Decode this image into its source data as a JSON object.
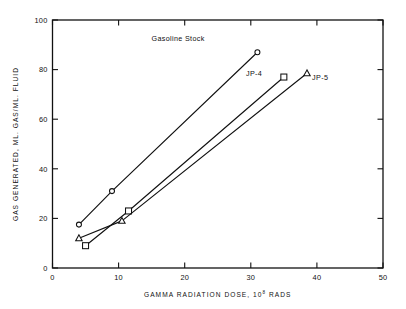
{
  "chart_data": {
    "type": "line",
    "title": "",
    "xlabel": "GAMMA RADIATION DOSE, 10",
    "xlabel_exponent": "8",
    "xlabel_tail": " RADS",
    "ylabel": "GAS GENERATED, ML. GAS/ML. FLUID",
    "xlim": [
      0,
      50
    ],
    "ylim": [
      0,
      100
    ],
    "xticks": [
      0,
      10,
      20,
      30,
      40,
      50
    ],
    "yticks": [
      0,
      20,
      40,
      60,
      80,
      100
    ],
    "xtick_labels": [
      "0",
      "10",
      "20",
      "30",
      "40",
      "50"
    ],
    "ytick_labels": [
      "0",
      "20",
      "40",
      "60",
      "80",
      "100"
    ],
    "grid": false,
    "legend_position": "inline-annotations",
    "series": [
      {
        "name": "Gasoline Stock",
        "marker": "circle",
        "x": [
          4.0,
          9.0,
          31.0
        ],
        "y": [
          17.5,
          31.0,
          87.0
        ],
        "label_x": 19.0,
        "label_y": 91.5
      },
      {
        "name": "JP-4",
        "marker": "square",
        "x": [
          5.0,
          11.5,
          35.0
        ],
        "y": [
          9.0,
          23.0,
          77.0
        ],
        "label_x": 30.5,
        "label_y": 77.5
      },
      {
        "name": "JP-5",
        "marker": "triangle",
        "x": [
          4.0,
          10.5,
          38.5
        ],
        "y": [
          12.0,
          19.0,
          78.5
        ],
        "label_x": 40.5,
        "label_y": 76.0
      }
    ],
    "annotations": [
      {
        "text": "Gasoline Stock",
        "x": 19.0,
        "y": 91.5
      },
      {
        "text": "JP-4",
        "x": 30.5,
        "y": 77.5
      },
      {
        "text": "JP-5",
        "x": 40.5,
        "y": 76.0
      }
    ]
  },
  "colors": {
    "ink": "#111111",
    "background": "#ffffff",
    "marker_fill": "#ffffff"
  }
}
